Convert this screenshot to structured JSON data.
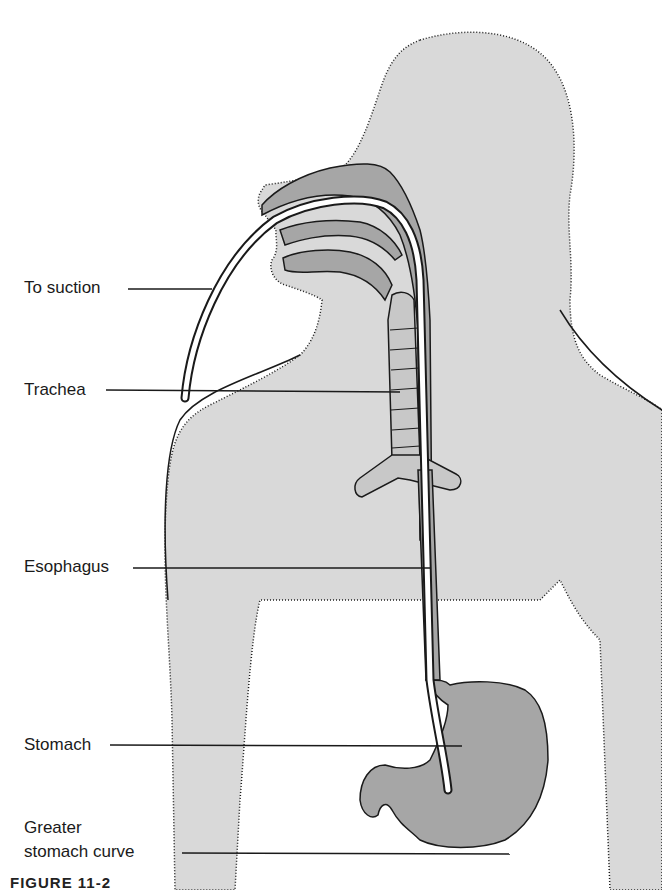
{
  "figure": {
    "caption": "FIGURE 11-2",
    "colors": {
      "body_fill": "#d9d9d9",
      "organ_fill": "#a6a6a6",
      "tube_fill": "#ffffff",
      "outline": "#1a1a1a",
      "background": "#ffffff"
    },
    "labels": [
      {
        "id": "to-suction",
        "text": "To suction"
      },
      {
        "id": "trachea",
        "text": "Trachea"
      },
      {
        "id": "esophagus",
        "text": "Esophagus"
      },
      {
        "id": "stomach",
        "text": "Stomach"
      },
      {
        "id": "greater-curve-line1",
        "text": "Greater"
      },
      {
        "id": "greater-curve-line2",
        "text": "stomach curve"
      }
    ]
  }
}
